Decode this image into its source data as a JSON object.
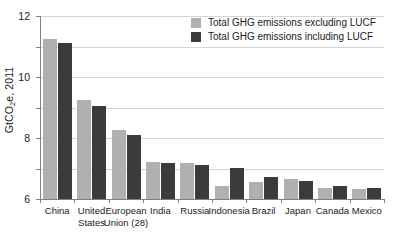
{
  "chart_data": {
    "type": "bar",
    "title": "",
    "xlabel": "",
    "ylabel": "GtCO2e, 2011",
    "ylabel_parts": {
      "prefix": "GtCO",
      "sub": "2",
      "suffix": "e, 2011"
    },
    "ylim": [
      0,
      12
    ],
    "yticks": [
      0,
      2,
      4,
      6,
      8,
      10,
      12
    ],
    "ytick_labels": [
      "0",
      "2",
      "4",
      "6",
      "8",
      "10",
      "12"
    ],
    "grid": true,
    "legend_position": "top-right",
    "categories": [
      "China",
      "United States",
      "European Union (28)",
      "India",
      "Russia",
      "Indonesia",
      "Brazil",
      "Japan",
      "Canada",
      "Mexico"
    ],
    "category_label_lines": [
      [
        "China"
      ],
      [
        "United",
        "States"
      ],
      [
        "European",
        "Union (28)"
      ],
      [
        "India"
      ],
      [
        "Russia"
      ],
      [
        "Indonesia"
      ],
      [
        "Brazil"
      ],
      [
        "Japan"
      ],
      [
        "Canada"
      ],
      [
        "Mexico"
      ]
    ],
    "series": [
      {
        "name": "Total GHG emissions excluding LUCF",
        "color": "#b0b0b0",
        "values": [
          10.5,
          6.5,
          4.5,
          2.45,
          2.37,
          0.85,
          1.1,
          1.3,
          0.75,
          0.68
        ]
      },
      {
        "name": "Total GHG emissions including LUCF",
        "color": "#3b3b3b",
        "values": [
          10.2,
          6.1,
          4.22,
          2.35,
          2.22,
          2.05,
          1.45,
          1.18,
          0.87,
          0.74
        ]
      }
    ]
  },
  "legend": {
    "items": [
      {
        "label": "Total GHG emissions excluding LUCF",
        "color": "#b0b0b0"
      },
      {
        "label": "Total GHG emissions including LUCF",
        "color": "#3b3b3b"
      }
    ]
  },
  "colors": {
    "excluding_lucf": "#b0b0b0",
    "including_lucf": "#3b3b3b",
    "axis": "#808080",
    "gridline": "#d4d4d4",
    "text": "#1a1a1a",
    "background": "#ffffff"
  }
}
